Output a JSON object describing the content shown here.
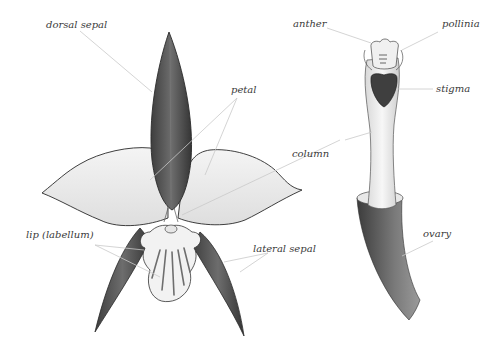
{
  "diagram": {
    "labels": {
      "dorsal_sepal": "dorsal sepal",
      "petal": "petal",
      "column": "column",
      "lip": "lip (labellum)",
      "lateral_sepal": "lateral sepal",
      "anther": "anther",
      "pollinia": "pollinia",
      "stigma": "stigma",
      "ovary": "ovary"
    },
    "colors": {
      "sepal_fill": "#5a5a5a",
      "petal_fill": "#ececec",
      "outline": "#2a2a2a",
      "leader_line": "#c9c9c9",
      "label_text": "#3a3a3a",
      "stigma_fill": "#444444"
    }
  }
}
